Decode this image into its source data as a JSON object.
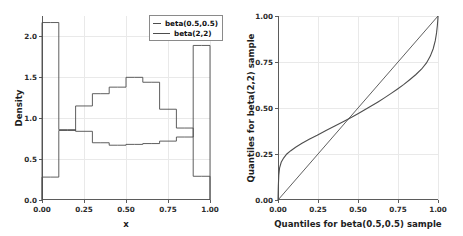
{
  "figure": {
    "background": "#ffffff",
    "line_color": "#4d4d4d",
    "grid_color": "#e9e9e9",
    "axis_color": "#5b5b5b"
  },
  "chart_data": [
    {
      "type": "bar",
      "panel": "left",
      "title": "",
      "xlabel": "x",
      "ylabel": "Density",
      "xlim": [
        0.0,
        1.0
      ],
      "ylim": [
        0.0,
        2.25
      ],
      "grid": true,
      "xticks": [
        0.0,
        0.25,
        0.5,
        0.75,
        1.0
      ],
      "xticklabels": [
        "0.00",
        "0.25",
        "0.50",
        "0.75",
        "1.00"
      ],
      "yticks": [
        0.0,
        0.5,
        1.0,
        1.5,
        2.0
      ],
      "yticklabels": [
        "0.0",
        "0.5",
        "1.0",
        "1.5",
        "2.0"
      ],
      "legend": {
        "position": "upper right",
        "entries": [
          "beta(0.5,0.5)",
          "beta(2,2)"
        ]
      },
      "bin_edges": [
        0.0,
        0.05,
        0.1,
        0.15,
        0.2,
        0.25,
        0.3,
        0.35,
        0.4,
        0.45,
        0.5,
        0.55,
        0.6,
        0.65,
        0.7,
        0.75,
        0.8,
        0.85,
        0.9,
        0.95,
        1.0
      ],
      "series": [
        {
          "name": "beta(0.5,0.5)",
          "values": [
            2.17,
            2.17,
            0.86,
            0.86,
            0.84,
            0.84,
            0.7,
            0.7,
            0.67,
            0.67,
            0.68,
            0.68,
            0.69,
            0.69,
            0.72,
            0.72,
            0.77,
            0.77,
            1.89,
            1.89
          ]
        },
        {
          "name": "beta(2,2)",
          "values": [
            0.28,
            0.28,
            0.85,
            0.85,
            1.15,
            1.15,
            1.3,
            1.3,
            1.38,
            1.38,
            1.5,
            1.5,
            1.44,
            1.44,
            1.11,
            1.11,
            0.88,
            0.88,
            0.29,
            0.29
          ]
        }
      ]
    },
    {
      "type": "line",
      "panel": "right",
      "title": "",
      "xlabel": "Quantiles for beta(0.5,0.5) sample",
      "ylabel": "Quantiles for beta(2,2) sample",
      "xlim": [
        0.0,
        1.0
      ],
      "ylim": [
        0.0,
        1.0
      ],
      "grid": true,
      "xticks": [
        0.0,
        0.25,
        0.5,
        0.75,
        1.0
      ],
      "xticklabels": [
        "0.00",
        "0.25",
        "0.50",
        "0.75",
        "1.00"
      ],
      "yticks": [
        0.0,
        0.25,
        0.5,
        0.75,
        1.0
      ],
      "yticklabels": [
        "0.00",
        "0.25",
        "0.50",
        "0.75",
        "1.00"
      ],
      "series": [
        {
          "name": "qq-curve",
          "x": [
            0.0,
            0.002,
            0.005,
            0.01,
            0.02,
            0.035,
            0.055,
            0.08,
            0.11,
            0.15,
            0.195,
            0.245,
            0.3,
            0.355,
            0.41,
            0.46,
            0.505,
            0.545,
            0.585,
            0.625,
            0.665,
            0.705,
            0.745,
            0.785,
            0.825,
            0.862,
            0.898,
            0.928,
            0.952,
            0.97,
            0.983,
            0.991,
            0.996,
            0.999,
            1.0
          ],
          "y": [
            0.0,
            0.075,
            0.135,
            0.175,
            0.205,
            0.228,
            0.25,
            0.268,
            0.287,
            0.308,
            0.33,
            0.352,
            0.378,
            0.402,
            0.427,
            0.45,
            0.472,
            0.492,
            0.512,
            0.533,
            0.555,
            0.578,
            0.602,
            0.627,
            0.655,
            0.682,
            0.712,
            0.745,
            0.782,
            0.822,
            0.866,
            0.908,
            0.948,
            0.982,
            1.0
          ]
        },
        {
          "name": "reference-line",
          "x": [
            0.0,
            1.0
          ],
          "y": [
            0.0,
            1.0
          ]
        }
      ]
    }
  ]
}
